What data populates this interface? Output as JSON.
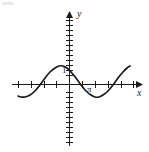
{
  "figure": {
    "title": "",
    "background_color": "#ffffff",
    "stroke_color": "#1a1a1a"
  },
  "labels": {
    "x_axis": "x",
    "y_axis": "y",
    "unit_marker": "1",
    "pi_marker": "π"
  },
  "chart_data": {
    "type": "line",
    "title": "",
    "xlabel": "x",
    "ylabel": "y",
    "grid": false,
    "legend": "none",
    "function": "y = cos(x)",
    "amplitude": 1,
    "period": 6.283,
    "xlim": [
      -6.8,
      4.6
    ],
    "ylim": [
      -4.2,
      4.6
    ],
    "x_tick_interval": 1.5708,
    "y_tick_interval": 0.5,
    "x_ticks": [
      -6.283,
      -4.712,
      -3.142,
      -1.571,
      0,
      1.571,
      3.142
    ],
    "y_ticks": [
      -4,
      -3.5,
      -3,
      -2.5,
      -2,
      -1.5,
      -1,
      -0.5,
      0.5,
      1,
      1.5,
      2,
      2.5,
      3,
      3.5,
      4
    ],
    "annotations": [
      {
        "text": "1",
        "x": 0,
        "y": 1,
        "placement": "left-of-y-axis"
      },
      {
        "text": "π",
        "x": 3.142,
        "y": 0,
        "placement": "below-x-axis"
      }
    ],
    "x": [
      -6.8,
      -6.28,
      -5.76,
      -5.24,
      -4.71,
      -4.19,
      -3.67,
      -3.14,
      -2.62,
      -2.09,
      -1.57,
      -1.05,
      -0.52,
      0,
      0.52,
      1.05,
      1.57,
      2.09,
      2.62,
      3.14,
      3.67,
      4.19,
      4.6
    ],
    "y": [
      0.87,
      1,
      0.87,
      0.5,
      0,
      -0.5,
      -0.87,
      -1,
      -0.87,
      -0.5,
      0,
      0.5,
      0.87,
      1,
      0.87,
      0.5,
      0,
      -0.5,
      -0.87,
      -1,
      -0.87,
      -0.5,
      -0.11
    ],
    "curve_points_px": [
      [
        18,
        96
      ],
      [
        21,
        97
      ],
      [
        25,
        97
      ],
      [
        30,
        95
      ],
      [
        35,
        91
      ],
      [
        40,
        85
      ],
      [
        45,
        78
      ],
      [
        50,
        72
      ],
      [
        55,
        68
      ],
      [
        59,
        66
      ],
      [
        63,
        66
      ],
      [
        67,
        68
      ],
      [
        71,
        72
      ],
      [
        76,
        78
      ],
      [
        81,
        85
      ],
      [
        86,
        91
      ],
      [
        91,
        95
      ],
      [
        95,
        97
      ],
      [
        99,
        97
      ],
      [
        103,
        95
      ],
      [
        108,
        91
      ],
      [
        113,
        85
      ],
      [
        118,
        78
      ],
      [
        123,
        72
      ],
      [
        127,
        68
      ],
      [
        130,
        66
      ]
    ]
  },
  "geometry": {
    "origin_px": [
      69,
      84
    ],
    "x_axis_y_px": 84,
    "y_axis_x_px": 69,
    "x_axis_start_px": 12,
    "x_axis_end_px": 140,
    "y_axis_top_px": 12,
    "y_axis_bottom_px": 146
  }
}
